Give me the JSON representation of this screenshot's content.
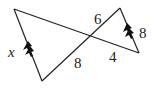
{
  "diagram": {
    "type": "similar-triangles-bowtie",
    "points": {
      "A": [
        14,
        9
      ],
      "B": [
        42,
        81
      ],
      "M": [
        91,
        36
      ],
      "C": [
        120,
        8
      ],
      "D": [
        139,
        53
      ]
    },
    "labels": {
      "left_side": "x",
      "upper_right_segment": "6",
      "lower_left_segment": "8",
      "lower_right_segment": "4",
      "right_side": "8"
    },
    "parallel_marks": "double-arrow",
    "line_color": "#222222"
  }
}
